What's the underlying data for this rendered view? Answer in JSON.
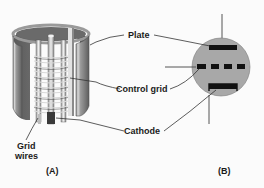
{
  "figure": {
    "panel_a": {
      "caption": "(A)",
      "description": "cutaway-vacuum-tube-triode"
    },
    "panel_b": {
      "caption": "(B)",
      "description": "triode-schematic-symbol"
    },
    "labels": {
      "plate": "Plate",
      "control_grid": "Control grid",
      "cathode": "Cathode",
      "grid_wires_line1": "Grid",
      "grid_wires_line2": "wires"
    },
    "colors": {
      "background": "#fbfbfb",
      "symbol_fill": "#a8a8a8",
      "electrode": "#111111",
      "leader_line": "#333333",
      "cylinder_dark": "#6e6e6e",
      "cylinder_light": "#d4d4d4"
    }
  }
}
